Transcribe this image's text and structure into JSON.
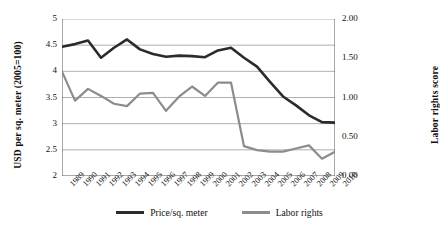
{
  "chart_data": {
    "type": "line",
    "title": "",
    "xlabel": "",
    "grid": true,
    "legend_position": "bottom",
    "categories": [
      1989,
      1990,
      1991,
      1992,
      1993,
      1994,
      1995,
      1996,
      1997,
      1998,
      1999,
      2000,
      2001,
      2002,
      2003,
      2004,
      2005,
      2006,
      2007,
      2008,
      2009,
      2010
    ],
    "xtick_labels": [
      "1989",
      "1990",
      "1991",
      "1992",
      "1993",
      "1994",
      "1995",
      "1996",
      "1997",
      "1998",
      "1999",
      "2000",
      "2001",
      "2002",
      "2003",
      "2004",
      "2005",
      "2006",
      "2007",
      "2008",
      "2009",
      "2010"
    ],
    "axes": {
      "left": {
        "label": "USD per sq. meter (2005=100)",
        "ylim": [
          2,
          5
        ],
        "ticks": [
          2,
          2.5,
          3,
          3.5,
          4,
          4.5,
          5
        ],
        "tick_labels": [
          "2",
          "2.5",
          "3",
          "3.5",
          "4",
          "4.5",
          "5"
        ]
      },
      "right": {
        "label": "Labor rights score",
        "ylim": [
          0.0,
          2.0
        ],
        "ticks": [
          0.0,
          0.5,
          1.0,
          1.5,
          2.0
        ],
        "tick_labels": [
          "0.00",
          "0.50",
          "1.00",
          "1.50",
          "2.00"
        ]
      }
    },
    "series": [
      {
        "name": "Price/sq. meter",
        "axis": "left",
        "color": "#2b2b2b",
        "width": 2.6,
        "values": [
          4.47,
          4.52,
          4.59,
          4.26,
          4.45,
          4.61,
          4.42,
          4.33,
          4.28,
          4.3,
          4.29,
          4.27,
          4.4,
          4.45,
          4.26,
          4.09,
          3.8,
          3.52,
          3.35,
          3.16,
          3.03,
          3.02
        ]
      },
      {
        "name": "Labor rights",
        "axis": "right",
        "color": "#8c8c8c",
        "width": 2.2,
        "values": [
          1.33,
          0.96,
          1.11,
          1.02,
          0.92,
          0.89,
          1.05,
          1.06,
          0.83,
          1.01,
          1.14,
          1.02,
          1.19,
          1.19,
          0.38,
          0.33,
          0.31,
          0.31,
          0.35,
          0.39,
          0.22,
          0.31
        ]
      }
    ]
  },
  "legend": {
    "items": [
      {
        "label": "Price/sq. meter",
        "color": "#2b2b2b"
      },
      {
        "label": "Labor rights",
        "color": "#8c8c8c"
      }
    ]
  }
}
